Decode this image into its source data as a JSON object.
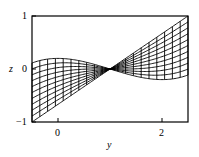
{
  "chart_data": {
    "type": "line",
    "title": "",
    "xlabel": "y",
    "ylabel": "z",
    "xlim": [
      -0.5,
      2.5
    ],
    "ylim": [
      -1,
      1
    ],
    "x_ticks": [
      0,
      2
    ],
    "x_tick_labels": [
      "0",
      "2"
    ],
    "y_ticks": [
      -1,
      0,
      1
    ],
    "y_tick_labels": [
      "-1",
      "0",
      "1"
    ],
    "grid": false,
    "legend": null,
    "family": {
      "pivot": [
        1,
        0
      ],
      "curve_count": 11,
      "flattest_curve": {
        "formula": "z = 0.1(y-1)^3 - 0.3(y-1)",
        "y": [
          -0.5,
          0,
          0.5,
          1,
          1.5,
          2,
          2.5
        ],
        "z": [
          0.11,
          0.2,
          0.14,
          0,
          -0.14,
          -0.2,
          -0.11
        ]
      },
      "steepest_curve": {
        "formula": "z = (2/3)(y-1)",
        "y": [
          -0.5,
          0,
          0.5,
          1,
          1.5,
          2,
          2.5
        ],
        "z": [
          -1,
          -0.67,
          -0.33,
          0,
          0.33,
          0.67,
          1
        ]
      },
      "mesh_spacing_y": 0.15
    },
    "line_color": "#000000"
  },
  "labels": {
    "z_axis": "z",
    "y_axis": "y",
    "z_tick_top": "1",
    "z_tick_mid": "0",
    "z_tick_bottom": "−1",
    "y_tick_0": "0",
    "y_tick_2": "2"
  }
}
